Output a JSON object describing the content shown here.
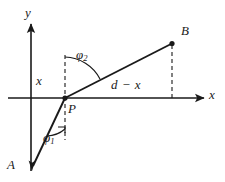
{
  "figure": {
    "background_color": "#ffffff",
    "stroke_color": "#1a1a1a",
    "axes": {
      "y_axis_label": "y",
      "x_axis_label": "x",
      "origin_px": [
        31,
        98
      ]
    },
    "points": [
      {
        "id": "A",
        "label": "A",
        "px": [
          32,
          170
        ],
        "marker": "arrowhead"
      },
      {
        "id": "P",
        "label": "P",
        "px": [
          65,
          98
        ],
        "marker": "dot"
      },
      {
        "id": "B",
        "label": "B",
        "px": [
          172,
          43
        ],
        "marker": "dot"
      }
    ],
    "segments": [
      {
        "id": "AP",
        "from": "A",
        "to": "P",
        "style": "solid"
      },
      {
        "id": "PB",
        "from": "P",
        "to": "B",
        "style": "solid"
      }
    ],
    "dashed_lines": [
      {
        "id": "normal-at-P",
        "from_px": [
          65,
          55
        ],
        "to_px": [
          65,
          140
        ]
      },
      {
        "id": "drop-from-B",
        "from_px": [
          172,
          43
        ],
        "to_px": [
          172,
          98
        ]
      }
    ],
    "angles": [
      {
        "id": "phi1",
        "symbol": "φ",
        "subscript": "1",
        "at_point": "P",
        "between": "downward normal and PA"
      },
      {
        "id": "phi2",
        "symbol": "φ",
        "subscript": "2",
        "at_point": "P",
        "between": "upward normal and PB"
      }
    ],
    "distance_labels": [
      {
        "id": "x-segment",
        "text": "x",
        "meaning": "horizontal distance from y-axis to P"
      },
      {
        "id": "d-minus-x",
        "text": "d − x",
        "meaning": "horizontal distance from P to B foot"
      }
    ]
  }
}
